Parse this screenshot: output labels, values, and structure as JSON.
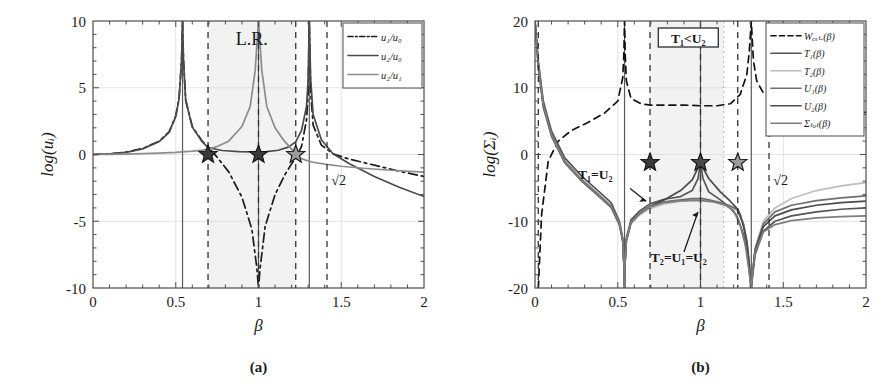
{
  "figure": {
    "panels": [
      {
        "id": "a",
        "caption": "(a)",
        "xlabel": "β",
        "ylabel": "log(uᵢ)",
        "xticks": [
          "0",
          "0.5",
          "1",
          "1.5",
          "2"
        ],
        "yticks": [
          "10",
          "5",
          "0",
          "-5",
          "-10"
        ],
        "annotations": [
          {
            "name": "lr-label",
            "text": "L.R."
          },
          {
            "name": "sqrt2-label",
            "text": "√2"
          }
        ],
        "legend": [
          {
            "label": "u₁/u₀",
            "style": "dashdot",
            "color": "#1c1c1c"
          },
          {
            "label": "u₂/u₀",
            "style": "solid",
            "color": "#4a4a4a"
          },
          {
            "label": "u₂/u₁",
            "style": "solid",
            "color": "#8c8c8c"
          }
        ]
      },
      {
        "id": "b",
        "caption": "(b)",
        "xlabel": "β",
        "ylabel": "log(Σᵢ)",
        "xticks": [
          "0",
          "0.5",
          "1",
          "1.5",
          "2"
        ],
        "yticks": [
          "20",
          "10",
          "0",
          "-10",
          "-20"
        ],
        "annotations": [
          {
            "name": "inequality-box",
            "text": "T₁<U₂"
          },
          {
            "name": "t1-equals-u2-label",
            "text": "T₁=U₂"
          },
          {
            "name": "t2-equals-u1-equals-u2-label",
            "text": "T₂=U₁=U₂"
          },
          {
            "name": "sqrt2-label",
            "text": "√2"
          }
        ],
        "legend": [
          {
            "label": "Wₑₓₜ.(β)",
            "style": "dashed",
            "color": "#111111"
          },
          {
            "label": "T₁(β)",
            "style": "solid",
            "color": "#555555"
          },
          {
            "label": "T₂(β)",
            "style": "solid",
            "color": "#bdbdbd"
          },
          {
            "label": "U₁(β)",
            "style": "solid",
            "color": "#6e6e6e"
          },
          {
            "label": "U₂(β)",
            "style": "solid",
            "color": "#4a4a4a"
          },
          {
            "label": "Σₜₒₜ(β)",
            "style": "solid",
            "color": "#7d7d7d"
          }
        ]
      }
    ]
  },
  "chart_data": [
    {
      "type": "line",
      "panel": "a",
      "title": "",
      "xlabel": "β",
      "ylabel": "log(u_i)",
      "xlim": [
        0,
        2
      ],
      "ylim": [
        -10,
        10
      ],
      "xticks": [
        0,
        0.5,
        1,
        1.5,
        2
      ],
      "yticks": [
        -10,
        -5,
        0,
        5,
        10
      ],
      "grid": true,
      "legend_position": "top-right",
      "shaded_region": {
        "label": "L.R.",
        "xmin": 0.695,
        "xmax": 1.225,
        "color": "#f2f2f2"
      },
      "vertical_dashed_lines": [
        0.695,
        1.0,
        1.225,
        1.414
      ],
      "vertical_asymptotes": [
        0.541,
        1.0,
        1.307
      ],
      "markers": [
        {
          "name": "star-1",
          "x": 0.695,
          "y": 0.0,
          "color": "#3a3a3a"
        },
        {
          "name": "star-2",
          "x": 1.0,
          "y": 0.0,
          "color": "#3a3a3a"
        },
        {
          "name": "star-3",
          "x": 1.225,
          "y": 0.0,
          "color": "#9a9a9a"
        }
      ],
      "series": [
        {
          "name": "u1/u0",
          "style": "dashdot",
          "color": "#1c1c1c",
          "x": [
            0.0,
            0.1,
            0.2,
            0.3,
            0.4,
            0.46,
            0.5,
            0.52,
            0.535,
            0.541,
            0.547,
            0.56,
            0.6,
            0.66,
            0.695,
            0.75,
            0.82,
            0.9,
            0.96,
            0.99,
            1.0,
            1.01,
            1.04,
            1.1,
            1.16,
            1.2,
            1.225,
            1.26,
            1.29,
            1.3,
            1.307,
            1.315,
            1.33,
            1.38,
            1.45,
            1.55,
            1.7,
            1.85,
            2.0
          ],
          "y": [
            0.0,
            0.05,
            0.18,
            0.45,
            1.0,
            1.7,
            2.9,
            4.2,
            7.0,
            10.0,
            7.0,
            4.1,
            2.1,
            1.0,
            0.55,
            -0.2,
            -1.3,
            -3.2,
            -5.6,
            -8.5,
            -10.0,
            -8.5,
            -5.4,
            -3.0,
            -1.5,
            -0.7,
            -0.25,
            0.6,
            2.6,
            4.6,
            10.0,
            4.7,
            2.2,
            0.7,
            0.05,
            -0.35,
            -0.8,
            -1.25,
            -1.65
          ]
        },
        {
          "name": "u2/u0",
          "style": "solid",
          "color": "#4a4a4a",
          "x": [
            0.0,
            0.1,
            0.2,
            0.3,
            0.4,
            0.46,
            0.5,
            0.52,
            0.535,
            0.541,
            0.547,
            0.56,
            0.6,
            0.66,
            0.695,
            0.78,
            0.88,
            0.96,
            1.0,
            1.05,
            1.12,
            1.18,
            1.225,
            1.26,
            1.29,
            1.3,
            1.307,
            1.315,
            1.33,
            1.38,
            1.45,
            1.55,
            1.7,
            1.85,
            2.0
          ],
          "y": [
            0.0,
            0.04,
            0.16,
            0.42,
            0.97,
            1.66,
            2.86,
            4.16,
            6.95,
            10.0,
            6.95,
            4.05,
            2.05,
            0.95,
            0.52,
            0.3,
            0.22,
            0.2,
            0.2,
            0.22,
            0.32,
            0.55,
            0.95,
            1.8,
            3.6,
            5.6,
            10.0,
            5.7,
            3.0,
            1.1,
            0.05,
            -0.7,
            -1.65,
            -2.45,
            -3.15
          ]
        },
        {
          "name": "u2/u1",
          "style": "solid",
          "color": "#8c8c8c",
          "x": [
            0.0,
            0.1,
            0.2,
            0.3,
            0.4,
            0.5,
            0.6,
            0.66,
            0.695,
            0.75,
            0.82,
            0.9,
            0.95,
            0.98,
            0.99,
            1.0,
            1.01,
            1.02,
            1.05,
            1.1,
            1.15,
            1.19,
            1.21,
            1.222,
            1.225,
            1.228,
            1.24,
            1.28,
            1.33,
            1.4,
            1.5,
            1.65,
            1.8,
            2.0
          ],
          "y": [
            0.0,
            0.01,
            0.03,
            0.06,
            0.1,
            0.16,
            0.25,
            0.33,
            0.4,
            0.6,
            1.0,
            2.1,
            3.6,
            6.3,
            8.2,
            10.0,
            8.2,
            6.3,
            3.6,
            2.0,
            1.1,
            0.55,
            0.25,
            0.05,
            0.0,
            -0.05,
            -0.2,
            -0.4,
            -0.58,
            -0.72,
            -0.88,
            -1.05,
            -1.18,
            -1.32
          ]
        }
      ]
    },
    {
      "type": "line",
      "panel": "b",
      "title": "",
      "xlabel": "β",
      "ylabel": "log(Sigma_i)",
      "xlim": [
        0,
        2
      ],
      "ylim": [
        -20,
        20
      ],
      "xticks": [
        0,
        0.5,
        1,
        1.5,
        2
      ],
      "yticks": [
        -20,
        -10,
        0,
        10,
        20
      ],
      "grid": true,
      "legend_position": "top-right",
      "shaded_region": {
        "label": "",
        "xmin": 0.695,
        "xmax": 1.14,
        "color": "#f2f2f2"
      },
      "vertical_dashed_lines": [
        0.02,
        0.695,
        1.0,
        1.225,
        1.414
      ],
      "vertical_dotted_lines": [
        1.14
      ],
      "vertical_asymptotes": [
        0.541,
        1.0,
        1.307
      ],
      "markers": [
        {
          "name": "star-1",
          "x": 0.695,
          "y": -1.2,
          "color": "#3a3a3a"
        },
        {
          "name": "star-2",
          "x": 1.0,
          "y": -1.2,
          "color": "#4a4a4a"
        },
        {
          "name": "star-3",
          "x": 1.225,
          "y": -1.2,
          "color": "#9a9a9a"
        }
      ],
      "series": [
        {
          "name": "W_ext",
          "style": "dashed",
          "color": "#111111",
          "x": [
            0.02,
            0.04,
            0.08,
            0.14,
            0.22,
            0.32,
            0.42,
            0.5,
            0.53,
            0.537,
            0.541,
            0.545,
            0.552,
            0.58,
            0.64,
            0.7,
            0.8,
            0.9,
            1.0,
            1.1,
            1.18,
            1.24,
            1.28,
            1.295,
            1.303,
            1.307,
            1.311,
            1.32,
            1.34,
            1.38,
            1.45,
            1.55,
            1.7,
            1.85,
            2.0
          ],
          "y": [
            -20.0,
            -9.0,
            -1.0,
            2.0,
            3.6,
            4.8,
            6.2,
            8.0,
            11.5,
            15.0,
            20.0,
            15.0,
            11.0,
            8.4,
            7.6,
            7.4,
            7.4,
            7.4,
            7.3,
            7.3,
            7.6,
            9.0,
            12.0,
            15.5,
            18.5,
            20.0,
            18.0,
            14.0,
            11.0,
            9.2,
            8.2,
            7.6,
            7.0,
            6.6,
            6.3
          ]
        },
        {
          "name": "T1",
          "style": "solid",
          "color": "#555555",
          "x": [
            0.0,
            0.02,
            0.05,
            0.1,
            0.18,
            0.28,
            0.38,
            0.46,
            0.51,
            0.53,
            0.538,
            0.541,
            0.544,
            0.552,
            0.58,
            0.63,
            0.695,
            0.78,
            0.88,
            0.95,
            0.985,
            1.0,
            1.015,
            1.05,
            1.12,
            1.18,
            1.22,
            1.26,
            1.28,
            1.295,
            1.303,
            1.307,
            1.311,
            1.33,
            1.38,
            1.45,
            1.55,
            1.7,
            1.85,
            2.0
          ],
          "y": [
            20.0,
            14.0,
            8.0,
            3.5,
            -0.5,
            -3.2,
            -5.4,
            -7.2,
            -10.0,
            -12.5,
            -16.5,
            -20.0,
            -16.0,
            -12.5,
            -9.8,
            -8.5,
            -7.4,
            -6.7,
            -6.3,
            -5.4,
            -3.6,
            -1.2,
            -3.6,
            -5.6,
            -6.8,
            -8.0,
            -9.2,
            -12.0,
            -14.5,
            -17.5,
            -19.5,
            -20.0,
            -19.0,
            -15.0,
            -11.5,
            -10.0,
            -9.2,
            -8.6,
            -8.2,
            -8.0
          ]
        },
        {
          "name": "T2",
          "style": "solid",
          "color": "#bdbdbd",
          "x": [
            0.0,
            0.02,
            0.05,
            0.1,
            0.18,
            0.28,
            0.38,
            0.46,
            0.51,
            0.53,
            0.538,
            0.541,
            0.544,
            0.552,
            0.58,
            0.63,
            0.695,
            0.78,
            0.88,
            0.95,
            0.99,
            1.0,
            1.01,
            1.05,
            1.12,
            1.18,
            1.22,
            1.26,
            1.28,
            1.295,
            1.303,
            1.307,
            1.311,
            1.33,
            1.38,
            1.45,
            1.55,
            1.7,
            1.85,
            2.0
          ],
          "y": [
            20.0,
            13.0,
            7.0,
            2.6,
            -1.3,
            -4.0,
            -6.2,
            -8.0,
            -10.6,
            -13.0,
            -17.0,
            -20.0,
            -16.5,
            -13.0,
            -10.4,
            -9.1,
            -8.1,
            -7.4,
            -7.0,
            -6.8,
            -6.7,
            -6.7,
            -6.7,
            -6.9,
            -7.3,
            -7.8,
            -8.3,
            -10.5,
            -13.0,
            -16.5,
            -19.0,
            -20.0,
            -18.5,
            -14.0,
            -10.0,
            -8.0,
            -6.6,
            -5.4,
            -4.7,
            -4.2
          ]
        },
        {
          "name": "U1",
          "style": "solid",
          "color": "#6e6e6e",
          "x": [
            0.0,
            0.02,
            0.05,
            0.1,
            0.18,
            0.28,
            0.38,
            0.46,
            0.51,
            0.53,
            0.538,
            0.541,
            0.544,
            0.552,
            0.58,
            0.63,
            0.695,
            0.78,
            0.88,
            0.95,
            0.99,
            1.0,
            1.01,
            1.05,
            1.12,
            1.18,
            1.22,
            1.26,
            1.28,
            1.295,
            1.303,
            1.307,
            1.311,
            1.33,
            1.38,
            1.45,
            1.55,
            1.7,
            1.85,
            2.0
          ],
          "y": [
            20.0,
            13.6,
            7.6,
            3.0,
            -1.0,
            -3.7,
            -5.9,
            -7.7,
            -10.3,
            -12.8,
            -16.8,
            -20.0,
            -16.3,
            -12.8,
            -10.1,
            -8.8,
            -7.8,
            -7.1,
            -6.8,
            -6.6,
            -6.6,
            -6.6,
            -6.6,
            -6.8,
            -7.2,
            -7.7,
            -8.2,
            -10.4,
            -12.9,
            -16.4,
            -19.0,
            -20.0,
            -18.6,
            -14.2,
            -10.4,
            -8.6,
            -7.6,
            -6.9,
            -6.5,
            -6.2
          ]
        },
        {
          "name": "U2",
          "style": "solid",
          "color": "#4a4a4a",
          "x": [
            0.0,
            0.02,
            0.05,
            0.1,
            0.18,
            0.28,
            0.38,
            0.46,
            0.51,
            0.53,
            0.538,
            0.541,
            0.544,
            0.552,
            0.58,
            0.63,
            0.695,
            0.78,
            0.88,
            0.95,
            0.985,
            1.0,
            1.015,
            1.05,
            1.12,
            1.18,
            1.21,
            1.225,
            1.24,
            1.26,
            1.28,
            1.295,
            1.303,
            1.307,
            1.311,
            1.33,
            1.38,
            1.45,
            1.55,
            1.7,
            1.85,
            2.0
          ],
          "y": [
            20.0,
            13.2,
            7.2,
            2.8,
            -1.2,
            -3.9,
            -6.1,
            -7.9,
            -10.5,
            -12.9,
            -16.9,
            -20.0,
            -16.4,
            -12.9,
            -10.2,
            -8.9,
            -7.8,
            -6.8,
            -5.4,
            -3.8,
            -2.0,
            -1.2,
            -2.0,
            -3.6,
            -5.6,
            -7.0,
            -7.8,
            -8.2,
            -9.0,
            -10.8,
            -13.2,
            -16.6,
            -19.2,
            -20.0,
            -18.7,
            -14.4,
            -10.8,
            -9.2,
            -8.3,
            -7.6,
            -7.2,
            -7.0
          ]
        },
        {
          "name": "Sigma_tot",
          "style": "solid",
          "color": "#7d7d7d",
          "x": [
            0.0,
            0.02,
            0.05,
            0.1,
            0.18,
            0.28,
            0.38,
            0.46,
            0.51,
            0.53,
            0.538,
            0.541,
            0.544,
            0.552,
            0.58,
            0.63,
            0.695,
            0.78,
            0.88,
            0.95,
            1.0,
            1.08,
            1.15,
            1.2,
            1.24,
            1.27,
            1.29,
            1.3,
            1.307,
            1.313,
            1.33,
            1.38,
            1.45,
            1.55,
            1.7,
            1.85,
            2.0
          ],
          "y": [
            20.0,
            13.4,
            7.4,
            2.9,
            -1.1,
            -3.8,
            -6.0,
            -7.8,
            -10.4,
            -12.85,
            -16.85,
            -20.0,
            -16.35,
            -12.85,
            -10.15,
            -8.85,
            -7.85,
            -7.2,
            -6.95,
            -6.9,
            -6.9,
            -7.1,
            -7.6,
            -8.4,
            -10.6,
            -13.5,
            -16.8,
            -18.8,
            -20.0,
            -18.2,
            -14.6,
            -11.6,
            -10.5,
            -9.9,
            -9.5,
            -9.3,
            -9.2
          ]
        }
      ]
    }
  ]
}
